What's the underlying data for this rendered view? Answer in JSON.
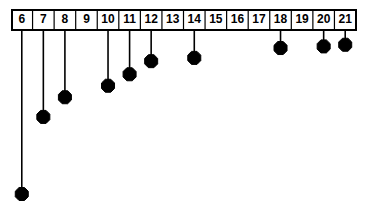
{
  "chart_data": {
    "type": "bar",
    "orientation": "downward-stem",
    "title": "",
    "subtitle": "",
    "xlabel": "",
    "ylabel": "",
    "grid": false,
    "legend": null,
    "categories": [
      "6",
      "7",
      "8",
      "9",
      "10",
      "11",
      "12",
      "13",
      "14",
      "15",
      "16",
      "17",
      "18",
      "19",
      "20",
      "21"
    ],
    "xlim": [
      6,
      21
    ],
    "ylim": [
      0,
      -1
    ],
    "axis_style": "boxed-tick-labels-row",
    "tick_labels": [
      "6",
      "7",
      "8",
      "9",
      "10",
      "11",
      "12",
      "13",
      "14",
      "15",
      "16",
      "17",
      "18",
      "19",
      "20",
      "21"
    ],
    "note": "Lollipop / stem plot hanging downward from a boxed axis row. Stem length is proportional to magnitude; values shown as normalized depth (0 = axis, 1 = deepest stem at category 6).",
    "points": [
      {
        "category": "6",
        "has_stem": true,
        "depth": 1.0,
        "marker": "filled-diamond"
      },
      {
        "category": "7",
        "has_stem": true,
        "depth": 0.53,
        "marker": "filled-diamond"
      },
      {
        "category": "8",
        "has_stem": true,
        "depth": 0.41,
        "marker": "filled-diamond"
      },
      {
        "category": "9",
        "has_stem": false,
        "depth": 0.0,
        "marker": "none"
      },
      {
        "category": "10",
        "has_stem": true,
        "depth": 0.34,
        "marker": "filled-diamond"
      },
      {
        "category": "11",
        "has_stem": true,
        "depth": 0.27,
        "marker": "filled-diamond"
      },
      {
        "category": "12",
        "has_stem": true,
        "depth": 0.19,
        "marker": "filled-diamond"
      },
      {
        "category": "13",
        "has_stem": false,
        "depth": 0.0,
        "marker": "none"
      },
      {
        "category": "14",
        "has_stem": true,
        "depth": 0.17,
        "marker": "filled-diamond"
      },
      {
        "category": "15",
        "has_stem": false,
        "depth": 0.0,
        "marker": "none"
      },
      {
        "category": "16",
        "has_stem": false,
        "depth": 0.0,
        "marker": "none"
      },
      {
        "category": "17",
        "has_stem": false,
        "depth": 0.0,
        "marker": "none"
      },
      {
        "category": "18",
        "has_stem": true,
        "depth": 0.11,
        "marker": "filled-diamond"
      },
      {
        "category": "19",
        "has_stem": false,
        "depth": 0.0,
        "marker": "none"
      },
      {
        "category": "20",
        "has_stem": true,
        "depth": 0.1,
        "marker": "filled-diamond"
      },
      {
        "category": "21",
        "has_stem": true,
        "depth": 0.09,
        "marker": "filled-diamond"
      }
    ],
    "colors": {
      "stem": "#000000",
      "marker": "#000000",
      "axis": "#000000",
      "background": "#ffffff"
    }
  },
  "geometry": {
    "width": 369,
    "height": 211,
    "box_left": 11,
    "box_right": 356,
    "box_top": 9,
    "box_bottom": 30,
    "cell_width": 21.5625,
    "baseline_y": 30,
    "max_depth_y": 194,
    "marker_radius": 6.5
  }
}
